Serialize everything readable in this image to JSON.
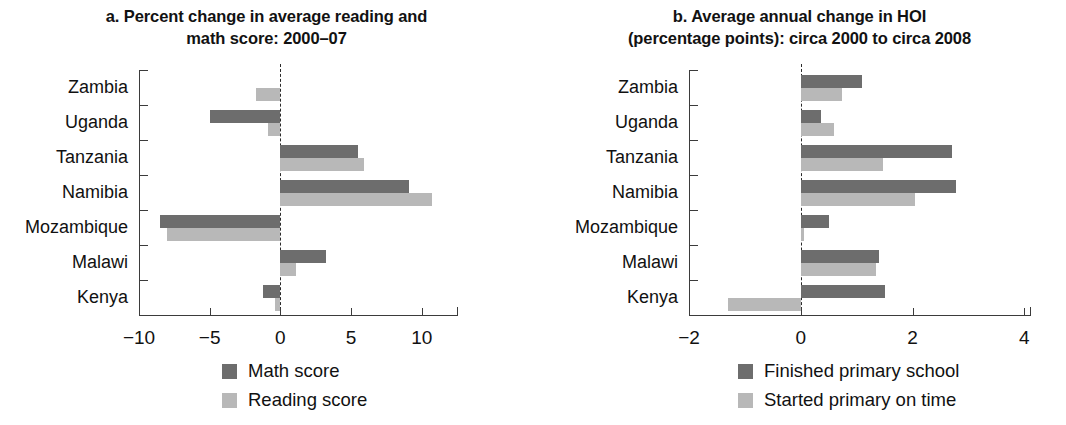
{
  "figure": {
    "panels": [
      {
        "id": "panel-a",
        "title_line1": "a. Percent change in average reading and",
        "title_line2": "math score: 2000–07",
        "legend": [
          {
            "label": "Math score",
            "color": "#6d6d6d"
          },
          {
            "label": "Reading score",
            "color": "#b8b8b8"
          }
        ],
        "tick_labels": [
          "−10",
          "−5",
          "0",
          "5",
          "10"
        ]
      },
      {
        "id": "panel-b",
        "title_line1": "b. Average annual change in HOI",
        "title_line2": "(percentage points): circa 2000 to circa 2008",
        "legend": [
          {
            "label": "Finished primary school",
            "color": "#6d6d6d"
          },
          {
            "label": "Started primary on time",
            "color": "#b8b8b8"
          }
        ],
        "tick_labels": [
          "−2",
          "0",
          "2",
          "4"
        ]
      }
    ]
  },
  "chart_data": [
    {
      "type": "bar",
      "orientation": "horizontal",
      "title": "a. Percent change in average reading and math score: 2000–07",
      "xlabel": "",
      "ylabel": "",
      "xlim": [
        -10,
        11.5
      ],
      "xticks": [
        -10,
        -5,
        0,
        5,
        10
      ],
      "grid": false,
      "legend_position": "bottom-center",
      "categories": [
        "Zambia",
        "Uganda",
        "Tanzania",
        "Namibia",
        "Mozambique",
        "Malawi",
        "Kenya"
      ],
      "series": [
        {
          "name": "Math score",
          "color": "#6d6d6d",
          "values": [
            0,
            -5.0,
            5.5,
            9.1,
            -8.5,
            3.2,
            -1.2
          ]
        },
        {
          "name": "Reading score",
          "color": "#b8b8b8",
          "values": [
            -1.7,
            -0.9,
            5.9,
            10.7,
            -8.0,
            1.1,
            -0.4
          ]
        }
      ]
    },
    {
      "type": "bar",
      "orientation": "horizontal",
      "title": "b. Average annual change in HOI (percentage points): circa 2000 to circa 2008",
      "xlabel": "",
      "ylabel": "",
      "xlim": [
        -2,
        4.1
      ],
      "xticks": [
        -2,
        0,
        2,
        4
      ],
      "grid": false,
      "legend_position": "bottom-center",
      "categories": [
        "Zambia",
        "Uganda",
        "Tanzania",
        "Namibia",
        "Mozambique",
        "Malawi",
        "Kenya"
      ],
      "series": [
        {
          "name": "Finished primary school",
          "color": "#6d6d6d",
          "values": [
            1.1,
            0.37,
            2.7,
            2.77,
            0.5,
            1.4,
            1.5
          ]
        },
        {
          "name": "Started primary on time",
          "color": "#b8b8b8",
          "values": [
            0.73,
            0.6,
            1.47,
            2.05,
            0.05,
            1.35,
            -1.3
          ]
        }
      ]
    }
  ]
}
